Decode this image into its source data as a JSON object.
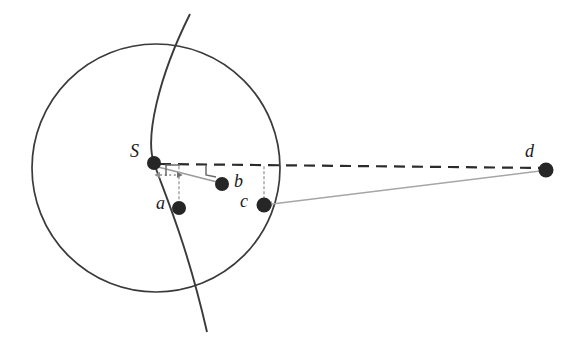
{
  "figure": {
    "background_color": "#ffffff",
    "stroke_color": "#3a3a3a",
    "point_color": "#262626",
    "gray_line_color": "#9a9a9a",
    "dashed_line_color": "#2b2b2b",
    "dotted_line_color": "#b0b0b0"
  },
  "points": [
    {
      "id": "S",
      "label": "S",
      "x": 154,
      "y": 163,
      "r": 7.0,
      "label_x": 130,
      "label_y": 142
    },
    {
      "id": "a",
      "label": "a",
      "x": 179,
      "y": 208,
      "r": 7.0,
      "label_x": 156,
      "label_y": 194
    },
    {
      "id": "b",
      "label": "b",
      "x": 222,
      "y": 184,
      "r": 7.0,
      "label_x": 234,
      "label_y": 172
    },
    {
      "id": "c",
      "label": "c",
      "x": 264,
      "y": 205,
      "r": 7.5,
      "label_x": 240,
      "label_y": 191
    },
    {
      "id": "d",
      "label": "d",
      "x": 546,
      "y": 170,
      "r": 7.5,
      "label_x": 525,
      "label_y": 142
    }
  ],
  "circle": {
    "name": "main-circle",
    "cx": 156,
    "cy": 168,
    "r": 124
  },
  "arc": {
    "name": "vertical-arc",
    "path": "M 190 14 C 158 78, 145 138, 154 163 C 163 190, 186 240, 207 332"
  },
  "segments": [
    {
      "name": "dashed-horizontal-S-to-d",
      "style": "dashed",
      "x1": 160,
      "y1": 164,
      "x2": 542,
      "y2": 168
    },
    {
      "name": "gray-line-S-to-b",
      "style": "solid-gray",
      "x1": 158,
      "y1": 167,
      "x2": 220,
      "y2": 183
    },
    {
      "name": "gray-line-c-to-d",
      "style": "solid-gray",
      "x1": 270,
      "y1": 204,
      "x2": 542,
      "y2": 171
    },
    {
      "name": "dotted-vertical-a",
      "style": "dotted",
      "x1": 179,
      "y1": 168,
      "x2": 179,
      "y2": 201
    },
    {
      "name": "dotted-vertical-c",
      "style": "dotted",
      "x1": 264,
      "y1": 167,
      "x2": 264,
      "y2": 198
    }
  ],
  "arrow": {
    "name": "double-headed-distance-arrow-S-a",
    "style": "dotted",
    "x1": 158,
    "y1": 175,
    "x2": 179,
    "y2": 175
  },
  "right_angle_markers": [
    {
      "name": "right-angle-marker-at-S",
      "path": "M 165 176 L 165 165 L 179 165"
    },
    {
      "name": "right-angle-marker-at-b-line",
      "path": "M 206 166 L 206 175 L 215 177"
    }
  ]
}
